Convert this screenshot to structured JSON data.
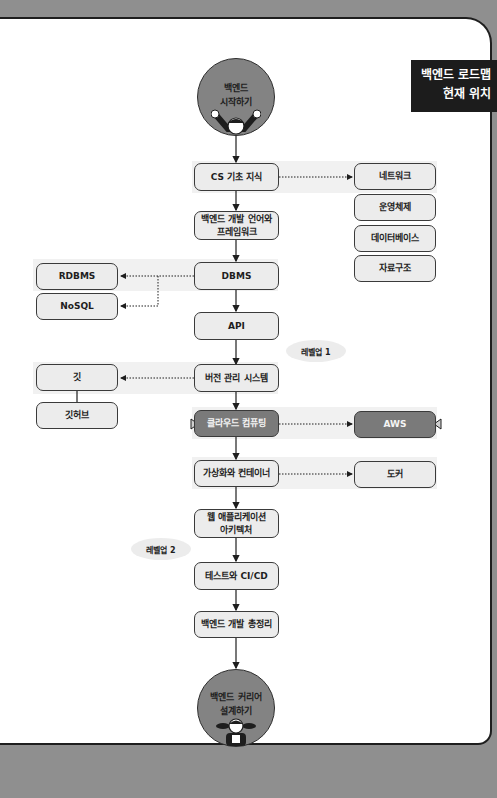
{
  "tag": {
    "line1": "백엔드 로드맵",
    "line2": "현재 위치"
  },
  "start": {
    "line1": "백엔드",
    "line2": "시작하기"
  },
  "end": {
    "line1": "백엔드 커리어",
    "line2": "설계하기"
  },
  "main_steps": [
    {
      "label": "CS 기초 지식"
    },
    {
      "line1": "백엔드 개발 언어와",
      "line2": "프레임워크"
    },
    {
      "label": "DBMS"
    },
    {
      "label": "API"
    },
    {
      "label": "버전 관리 시스템"
    },
    {
      "label": "클라우드 컴퓨팅",
      "current": true
    },
    {
      "label": "가상화와 컨테이너"
    },
    {
      "line1": "웹 애플리케이션",
      "line2": "아키텍처"
    },
    {
      "label": "테스트와 CI/CD"
    },
    {
      "label": "백엔드 개발 총정리"
    }
  ],
  "cs_topics": [
    "네트워크",
    "운영체제",
    "데이터베이스",
    "자료구조"
  ],
  "dbms_topics": [
    "RDBMS",
    "NoSQL"
  ],
  "vcs_topics": [
    "깃",
    "깃허브"
  ],
  "cloud_topics": [
    "AWS"
  ],
  "container_topics": [
    "도커"
  ],
  "levels": {
    "level1": "레벨업 1",
    "level2": "레벨업 2"
  }
}
